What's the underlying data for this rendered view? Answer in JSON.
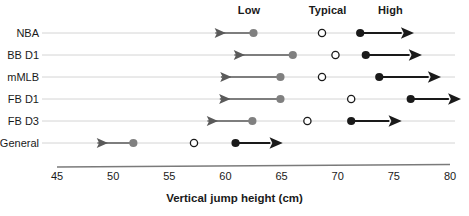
{
  "chart_data": {
    "type": "scatter",
    "title": "",
    "xlabel": "Vertical jump height (cm)",
    "ylabel": "",
    "xlim": [
      45,
      80
    ],
    "xticks": [
      45,
      50,
      55,
      60,
      65,
      70,
      75,
      80
    ],
    "xtick_labels": [
      "45",
      "50",
      "55",
      "60",
      "65",
      "70",
      "75",
      "80"
    ],
    "grid": true,
    "categories": [
      "NBA",
      "BB D1",
      "mMLB",
      "FB D1",
      "FB D3",
      "General"
    ],
    "column_headers": [
      "Low",
      "Typical",
      "High"
    ],
    "series": [
      {
        "name": "Low",
        "marker": "filled-gray-circle",
        "color": "#808080",
        "arrow_direction": "left",
        "values": [
          62.5,
          66.0,
          64.9,
          64.9,
          62.4,
          51.8
        ],
        "arrow_ends": [
          59.1,
          60.8,
          59.6,
          59.5,
          58.4,
          48.6
        ]
      },
      {
        "name": "Typical",
        "marker": "open-circle",
        "color": "#1a1a1a",
        "arrow_direction": "none",
        "values": [
          68.6,
          69.8,
          68.6,
          71.2,
          67.3,
          57.2
        ],
        "arrow_ends": [
          null,
          null,
          null,
          null,
          null,
          null
        ]
      },
      {
        "name": "High",
        "marker": "filled-black-circle",
        "color": "#1a1a1a",
        "arrow_direction": "right",
        "values": [
          72.0,
          72.5,
          73.7,
          76.5,
          71.2,
          60.9
        ],
        "arrow_ends": [
          75.7,
          76.4,
          78.1,
          79.9,
          74.6,
          64.0
        ]
      }
    ],
    "header_positions": [
      62.1,
      69.1,
      74.7
    ],
    "colors": {
      "low_marker": "#808080",
      "typical_marker_fill": "#ffffff",
      "typical_marker_stroke": "#1a1a1a",
      "high_marker": "#1a1a1a",
      "low_arrow": "#5a5a5a",
      "high_arrow": "#1a1a1a",
      "gridline": "#d4d4d4",
      "axis": "#7a7a7a",
      "text": "#1a1a1a",
      "background": "#ffffff"
    }
  }
}
